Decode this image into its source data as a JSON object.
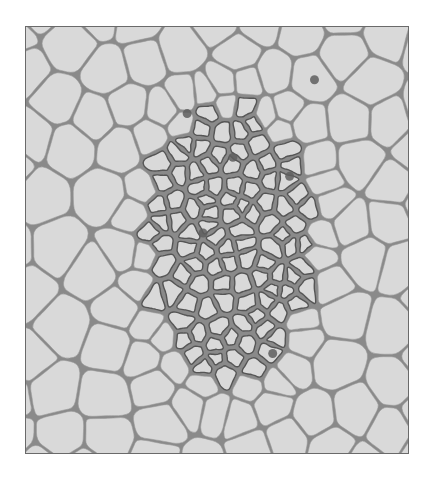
{
  "image": {
    "description": "Grayscale light micrograph of a plant tissue cross-section: central vascular bundle of small thick-walled cells surrounded by large thin-walled parenchyma cells",
    "colors": {
      "background": "#ffffff",
      "frame_border": "#6a6a6a",
      "cell_fill": "#d9d9d9",
      "cell_wall_thin": "#8a8a8a",
      "cell_wall_thick": "#555555",
      "nucleus": "#5e5e5e"
    },
    "frame": {
      "x": 25,
      "y": 26,
      "width": 384,
      "height": 428
    }
  },
  "cells": {
    "seed": 7,
    "center": [
      205,
      215
    ],
    "inner_radius_x": 80,
    "inner_radius_y": 130,
    "nuclei": [
      [
        162,
        87
      ],
      [
        265,
        150
      ],
      [
        178,
        207
      ],
      [
        208,
        131
      ],
      [
        248,
        328
      ],
      [
        290,
        53
      ]
    ]
  }
}
